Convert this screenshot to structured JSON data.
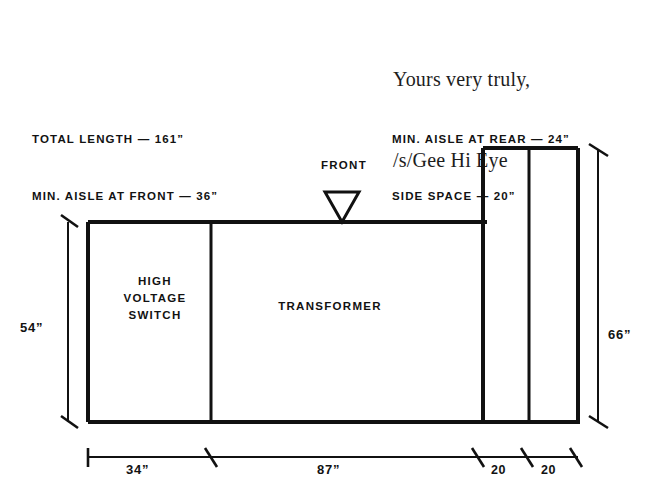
{
  "document": {
    "closing": {
      "line1": "Yours very truly,",
      "line2": "/s/Gee Hi Eye"
    }
  },
  "notes": {
    "left": {
      "line1": "TOTAL LENGTH — 161”",
      "line2": "MIN. AISLE AT FRONT — 36”"
    },
    "right": {
      "line1": "MIN. AISLE AT REAR — 24”",
      "line2": "SIDE SPACE — 20”"
    }
  },
  "figure": {
    "front_marker_label": "FRONT",
    "front_marker_icon": "down-triangle-icon",
    "rooms": [
      {
        "id": "high-voltage-switch",
        "label": "HIGH\nVOLTAGE\nSWITCH"
      },
      {
        "id": "transformer",
        "label": "TRANSFORMER"
      },
      {
        "id": "side-space-a",
        "label": ""
      },
      {
        "id": "side-space-b",
        "label": ""
      }
    ],
    "dimensions": {
      "left_height": "54”",
      "right_height": "66”",
      "bottom": [
        {
          "id": "dim-34",
          "label": "34”"
        },
        {
          "id": "dim-87",
          "label": "87”"
        },
        {
          "id": "dim-20-a",
          "label": "20"
        },
        {
          "id": "dim-20-b",
          "label": "20"
        }
      ]
    }
  },
  "colors": {
    "ink": "#111111",
    "paper": "#ffffff",
    "text": "#1d1d1d"
  }
}
